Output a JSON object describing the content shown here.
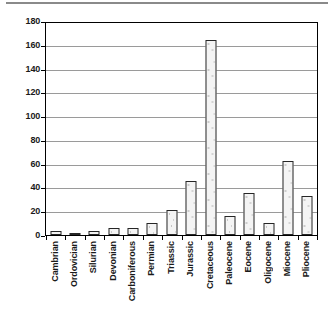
{
  "chart_data": {
    "type": "bar",
    "title": "",
    "subtitle": "",
    "xlabel": "",
    "ylabel": "",
    "ylim": [
      0,
      180
    ],
    "yticks": [
      0,
      20,
      40,
      60,
      80,
      100,
      120,
      140,
      160,
      180
    ],
    "ytick_labels": [
      "0",
      "20",
      "40",
      "60",
      "80",
      "100",
      "120",
      "140",
      "160",
      "180"
    ],
    "grid": true,
    "legend": null,
    "legend_position": "none",
    "categories": [
      "Cambrian",
      "Ordovician",
      "Silurian",
      "Devonian",
      "Carboniferous",
      "Permian",
      "Triassic",
      "Jurassic",
      "Cretaceous",
      "Paleocene",
      "Eocene",
      "Oligocene",
      "Miocene",
      "Pliocene"
    ],
    "values": [
      3,
      2,
      3,
      6,
      6,
      10,
      21,
      46,
      166,
      16,
      36,
      10,
      63,
      33
    ],
    "bar_fill_color": "#f4f4f4",
    "bar_edge_color": "#262626",
    "gridline_color": "#9a9a9a",
    "axis_color": "#000000",
    "background_color": "#ffffff"
  },
  "figure": {
    "name": "geological-period-bar-chart"
  }
}
